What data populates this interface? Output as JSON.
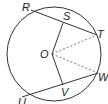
{
  "diagram": {
    "type": "circle-geometry",
    "center_label": "O",
    "labels": {
      "R": "R",
      "S": "S",
      "T": "T",
      "O": "O",
      "W": "W",
      "V": "V",
      "U": "U"
    },
    "segments": {
      "solid": [
        "RT",
        "UW",
        "OS",
        "OV"
      ],
      "dashed": [
        "OT",
        "OW"
      ]
    },
    "colors": {
      "stroke": "#333333",
      "background": "#ffffff"
    }
  }
}
